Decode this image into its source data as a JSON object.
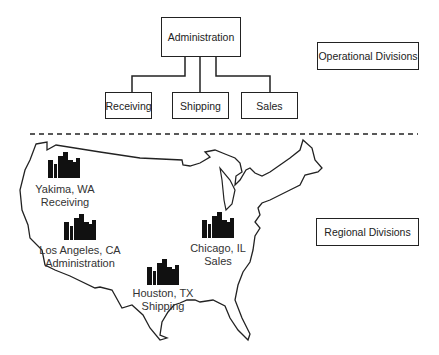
{
  "org_chart": {
    "root": "Administration",
    "children": [
      "Receiving",
      "Shipping",
      "Sales"
    ]
  },
  "legends": {
    "operational": "Operational Divisions",
    "regional": "Regional Divisions"
  },
  "locations": [
    {
      "city": "Yakima, WA",
      "division": "Receiving"
    },
    {
      "city": "Los Angeles, CA",
      "division": "Administration"
    },
    {
      "city": "Chicago, IL",
      "division": "Sales"
    },
    {
      "city": "Houston, TX",
      "division": "Shipping"
    }
  ]
}
